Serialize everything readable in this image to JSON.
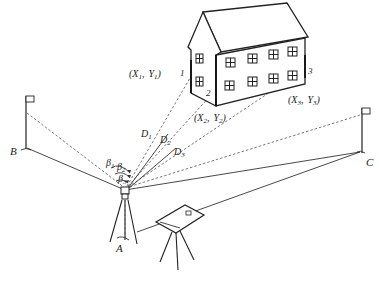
{
  "diagram": {
    "stations": {
      "A": "A",
      "B": "B",
      "C": "C"
    },
    "points": [
      {
        "id": "1",
        "coord_label": "(X",
        "coord": [
          "X",
          "1",
          "Y",
          "1"
        ]
      },
      {
        "id": "2",
        "coord": [
          "X",
          "2",
          "Y",
          "2"
        ]
      },
      {
        "id": "3",
        "coord": [
          "X",
          "3",
          "Y",
          "3"
        ]
      }
    ],
    "distances": [
      {
        "sym": "D",
        "sub": "1"
      },
      {
        "sym": "D",
        "sub": "2"
      },
      {
        "sym": "D",
        "sub": "3"
      }
    ],
    "angles": [
      {
        "sym": "β",
        "sub": "1"
      },
      {
        "sym": "β",
        "sub": "2"
      },
      {
        "sym": "β",
        "sub": "3"
      }
    ],
    "punct": {
      "open": "(",
      "comma": ",",
      "close": ")"
    }
  }
}
